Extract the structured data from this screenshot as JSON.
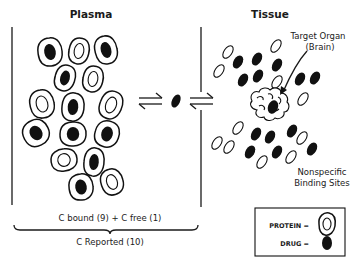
{
  "titles": {
    "plasma": "Plasma",
    "tissue": "Tissue"
  },
  "labels": {
    "target_organ_line1": "Target Organ",
    "target_organ_line2": "(Brain)",
    "nonspecific_line1": "Nonspecific",
    "nonspecific_line2": "Binding Sites",
    "concentration_sum": "C bound (9) + C free (1)",
    "concentration_reported": "C Reported (10)"
  },
  "legend": {
    "protein_label": "PROTEIN  =",
    "drug_label": "DRUG  ="
  },
  "icons": {
    "equilibrium_arrows": "equilibrium-arrows-icon",
    "protein": "protein-icon",
    "drug": "drug-icon",
    "brain": "brain-icon"
  },
  "colors": {
    "ink": "#111111",
    "background": "#ffffff"
  },
  "plasma_proteins": [
    {
      "cx": 50,
      "cy": 52,
      "rx": 12,
      "ry": 14,
      "rot": -10,
      "bound": true
    },
    {
      "cx": 79,
      "cy": 51,
      "rx": 10,
      "ry": 13,
      "rot": 10,
      "bound": false
    },
    {
      "cx": 106,
      "cy": 50,
      "rx": 11,
      "ry": 14,
      "rot": -15,
      "bound": true
    },
    {
      "cx": 65,
      "cy": 78,
      "rx": 10,
      "ry": 13,
      "rot": 15,
      "bound": true
    },
    {
      "cx": 93,
      "cy": 79,
      "rx": 10,
      "ry": 13,
      "rot": 10,
      "bound": false
    },
    {
      "cx": 42,
      "cy": 104,
      "rx": 12,
      "ry": 14,
      "rot": -15,
      "bound": false
    },
    {
      "cx": 73,
      "cy": 107,
      "rx": 11,
      "ry": 14,
      "rot": 5,
      "bound": true
    },
    {
      "cx": 111,
      "cy": 105,
      "rx": 11,
      "ry": 14,
      "rot": 20,
      "bound": false
    },
    {
      "cx": 36,
      "cy": 133,
      "rx": 13,
      "ry": 13,
      "rot": -30,
      "bound": true
    },
    {
      "cx": 73,
      "cy": 134,
      "rx": 13,
      "ry": 12,
      "rot": 0,
      "bound": true
    },
    {
      "cx": 107,
      "cy": 134,
      "rx": 12,
      "ry": 13,
      "rot": 15,
      "bound": true
    },
    {
      "cx": 64,
      "cy": 160,
      "rx": 13,
      "ry": 11,
      "rot": -10,
      "bound": false
    },
    {
      "cx": 94,
      "cy": 162,
      "rx": 10,
      "ry": 14,
      "rot": 5,
      "bound": true
    },
    {
      "cx": 81,
      "cy": 187,
      "rx": 12,
      "ry": 13,
      "rot": -10,
      "bound": true
    },
    {
      "cx": 112,
      "cy": 182,
      "rx": 11,
      "ry": 13,
      "rot": -20,
      "bound": false
    }
  ],
  "free_drug": {
    "cx": 176,
    "cy": 101,
    "rx": 4,
    "ry": 7,
    "rot": 25
  },
  "tissue_sites": [
    {
      "cx": 228,
      "cy": 52,
      "rx": 4,
      "ry": 7,
      "rot": 35,
      "filled": false
    },
    {
      "cx": 276,
      "cy": 46,
      "rx": 4,
      "ry": 7,
      "rot": 35,
      "filled": false
    },
    {
      "cx": 219,
      "cy": 71,
      "rx": 4,
      "ry": 7,
      "rot": 35,
      "filled": false
    },
    {
      "cx": 238,
      "cy": 62,
      "rx": 4.5,
      "ry": 7,
      "rot": 30,
      "filled": true
    },
    {
      "cx": 257,
      "cy": 59,
      "rx": 4.5,
      "ry": 7,
      "rot": 30,
      "filled": true
    },
    {
      "cx": 277,
      "cy": 65,
      "rx": 4.5,
      "ry": 7,
      "rot": 30,
      "filled": true
    },
    {
      "cx": 243,
      "cy": 80,
      "rx": 4.5,
      "ry": 7,
      "rot": 30,
      "filled": true
    },
    {
      "cx": 258,
      "cy": 76,
      "rx": 4.5,
      "ry": 7,
      "rot": 30,
      "filled": true
    },
    {
      "cx": 277,
      "cy": 82,
      "rx": 4,
      "ry": 7,
      "rot": 35,
      "filled": false
    },
    {
      "cx": 300,
      "cy": 79,
      "rx": 4.5,
      "ry": 7,
      "rot": 30,
      "filled": true
    },
    {
      "cx": 315,
      "cy": 78,
      "rx": 4.5,
      "ry": 7,
      "rot": 30,
      "filled": true
    },
    {
      "cx": 303,
      "cy": 99,
      "rx": 4,
      "ry": 7,
      "rot": 35,
      "filled": false
    },
    {
      "cx": 238,
      "cy": 128,
      "rx": 4,
      "ry": 7,
      "rot": 35,
      "filled": false
    },
    {
      "cx": 217,
      "cy": 143,
      "rx": 4,
      "ry": 7,
      "rot": 35,
      "filled": false
    },
    {
      "cx": 229,
      "cy": 147,
      "rx": 4,
      "ry": 7,
      "rot": 35,
      "filled": false
    },
    {
      "cx": 256,
      "cy": 134,
      "rx": 4.5,
      "ry": 7,
      "rot": 30,
      "filled": true
    },
    {
      "cx": 270,
      "cy": 137,
      "rx": 4.5,
      "ry": 7,
      "rot": 30,
      "filled": true
    },
    {
      "cx": 292,
      "cy": 131,
      "rx": 4.5,
      "ry": 7,
      "rot": 30,
      "filled": true
    },
    {
      "cx": 302,
      "cy": 138,
      "rx": 4,
      "ry": 7,
      "rot": 35,
      "filled": false
    },
    {
      "cx": 250,
      "cy": 152,
      "rx": 4.5,
      "ry": 7,
      "rot": 30,
      "filled": true
    },
    {
      "cx": 277,
      "cy": 152,
      "rx": 4.5,
      "ry": 7,
      "rot": 30,
      "filled": true
    },
    {
      "cx": 312,
      "cy": 149,
      "rx": 4.5,
      "ry": 7,
      "rot": 30,
      "filled": true
    },
    {
      "cx": 262,
      "cy": 162,
      "rx": 4,
      "ry": 7,
      "rot": 35,
      "filled": false
    },
    {
      "cx": 291,
      "cy": 157,
      "rx": 4,
      "ry": 7,
      "rot": 35,
      "filled": false
    }
  ],
  "brain_drug": {
    "cx": 273,
    "cy": 107,
    "rx": 5,
    "ry": 7,
    "rot": 20
  }
}
